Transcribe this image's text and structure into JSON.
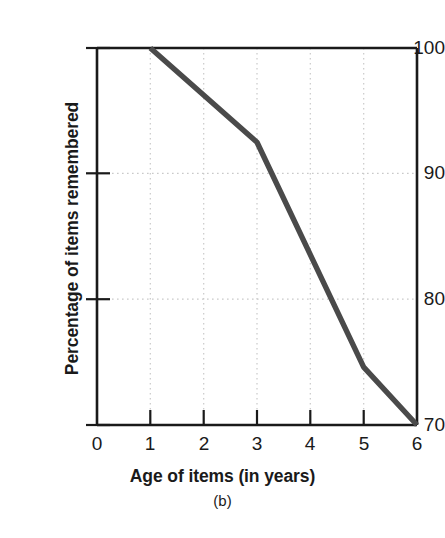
{
  "chart_data": {
    "type": "line",
    "title": "",
    "caption": "(b)",
    "xlabel": "Age of items (in years)",
    "ylabel": "Percentage of items remembered",
    "x": [
      1,
      3,
      5,
      6
    ],
    "values": [
      100,
      92.5,
      74.6,
      70
    ],
    "series": [
      {
        "name": "Percentage of items remembered",
        "x": [
          1,
          3,
          5,
          6
        ],
        "values": [
          100,
          92.5,
          74.6,
          70
        ],
        "color": "#4a4a4a"
      }
    ],
    "xlim": [
      0,
      6
    ],
    "ylim": [
      70,
      100
    ],
    "xticks": [
      0,
      1,
      2,
      3,
      4,
      5,
      6
    ],
    "xtick_labels": [
      "0",
      "1",
      "2",
      "3",
      "4",
      "5",
      "6"
    ],
    "yticks": [
      70,
      80,
      90,
      100
    ],
    "ytick_labels": [
      "70",
      "80",
      "90",
      "100"
    ],
    "grid": true,
    "grid_style": "dotted",
    "grid_color": "#cccccc",
    "legend": "none",
    "axis_color": "#1a1a1a"
  },
  "axes": {
    "y_title": "Percentage of items remembered",
    "x_title": "Age of items (in years)",
    "caption": "(b)",
    "ytick_labels": [
      "100",
      "90",
      "80",
      "70"
    ],
    "xtick_labels": [
      "0",
      "1",
      "2",
      "3",
      "4",
      "5",
      "6"
    ]
  }
}
